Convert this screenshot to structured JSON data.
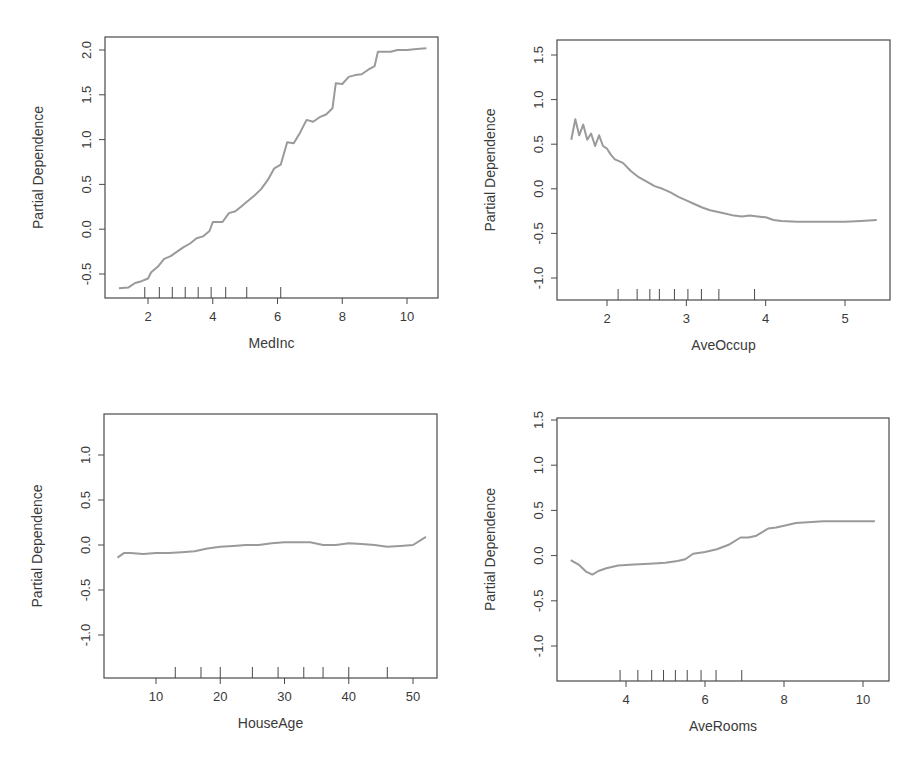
{
  "chart_data": [
    {
      "type": "line",
      "title": "",
      "xlabel": "MedInc",
      "ylabel": "Partial Dependence",
      "xlim": [
        0.8,
        11.0
      ],
      "ylim": [
        -0.75,
        2.1
      ],
      "xticks": [
        2,
        4,
        6,
        8,
        10
      ],
      "yticks": [
        -0.5,
        0.0,
        0.5,
        1.0,
        1.5,
        2.0
      ],
      "rug_deciles": [
        1.9,
        2.35,
        2.75,
        3.15,
        3.55,
        3.95,
        4.4,
        5.05,
        6.1
      ],
      "series": [
        {
          "name": "MedInc",
          "x": [
            1.1,
            1.4,
            1.6,
            1.8,
            2.0,
            2.1,
            2.3,
            2.5,
            2.7,
            2.9,
            3.1,
            3.3,
            3.5,
            3.7,
            3.9,
            4.0,
            4.1,
            4.3,
            4.5,
            4.7,
            4.9,
            5.1,
            5.3,
            5.5,
            5.7,
            5.9,
            6.1,
            6.3,
            6.5,
            6.7,
            6.9,
            7.1,
            7.3,
            7.5,
            7.7,
            7.8,
            8.0,
            8.2,
            8.4,
            8.6,
            8.8,
            9.0,
            9.1,
            9.3,
            9.5,
            9.7,
            10.0,
            10.3,
            10.6
          ],
          "y": [
            -0.66,
            -0.65,
            -0.6,
            -0.58,
            -0.55,
            -0.48,
            -0.42,
            -0.33,
            -0.3,
            -0.25,
            -0.2,
            -0.16,
            -0.1,
            -0.08,
            -0.02,
            0.08,
            0.08,
            0.08,
            0.18,
            0.2,
            0.26,
            0.32,
            0.38,
            0.45,
            0.55,
            0.68,
            0.72,
            0.97,
            0.96,
            1.08,
            1.22,
            1.2,
            1.25,
            1.28,
            1.35,
            1.63,
            1.62,
            1.7,
            1.72,
            1.73,
            1.78,
            1.82,
            1.98,
            1.98,
            1.98,
            2.0,
            2.0,
            2.01,
            2.02
          ]
        }
      ]
    },
    {
      "type": "line",
      "title": "",
      "xlabel": "AveOccup",
      "ylabel": "Partial Dependence",
      "xlim": [
        1.4,
        5.5
      ],
      "ylim": [
        -1.25,
        1.65
      ],
      "xticks": [
        2,
        3,
        4,
        5
      ],
      "yticks": [
        -1.0,
        -0.5,
        0.0,
        0.5,
        1.0,
        1.5
      ],
      "rug_deciles": [
        2.14,
        2.38,
        2.54,
        2.66,
        2.85,
        3.02,
        3.19,
        3.41,
        3.86
      ],
      "series": [
        {
          "name": "AveOccup",
          "x": [
            1.55,
            1.6,
            1.65,
            1.7,
            1.75,
            1.8,
            1.85,
            1.9,
            1.95,
            2.0,
            2.05,
            2.1,
            2.2,
            2.3,
            2.4,
            2.5,
            2.6,
            2.7,
            2.8,
            2.9,
            3.0,
            3.1,
            3.2,
            3.3,
            3.4,
            3.5,
            3.6,
            3.7,
            3.8,
            3.9,
            4.0,
            4.1,
            4.2,
            4.4,
            4.6,
            4.8,
            5.0,
            5.2,
            5.4
          ],
          "y": [
            0.55,
            0.78,
            0.6,
            0.72,
            0.55,
            0.62,
            0.48,
            0.6,
            0.48,
            0.45,
            0.38,
            0.33,
            0.29,
            0.2,
            0.13,
            0.08,
            0.03,
            0.0,
            -0.04,
            -0.09,
            -0.13,
            -0.17,
            -0.21,
            -0.24,
            -0.26,
            -0.28,
            -0.3,
            -0.31,
            -0.3,
            -0.31,
            -0.32,
            -0.35,
            -0.36,
            -0.37,
            -0.37,
            -0.37,
            -0.37,
            -0.36,
            -0.35
          ]
        }
      ]
    },
    {
      "type": "line",
      "title": "",
      "xlabel": "HouseAge",
      "ylabel": "Partial Dependence",
      "xlim": [
        2,
        54
      ],
      "ylim": [
        -1.45,
        1.45
      ],
      "xticks": [
        10,
        20,
        30,
        40,
        50
      ],
      "yticks": [
        -1.0,
        -0.5,
        0.0,
        0.5,
        1.0
      ],
      "rug_deciles": [
        13,
        17,
        20,
        25,
        29,
        33,
        36,
        40,
        46
      ],
      "series": [
        {
          "name": "HouseAge",
          "x": [
            4,
            5,
            6,
            8,
            10,
            12,
            14,
            16,
            18,
            20,
            22,
            24,
            26,
            28,
            30,
            32,
            34,
            36,
            38,
            40,
            42,
            44,
            46,
            48,
            50,
            52
          ],
          "y": [
            -0.14,
            -0.09,
            -0.09,
            -0.1,
            -0.09,
            -0.09,
            -0.08,
            -0.07,
            -0.04,
            -0.02,
            -0.01,
            0.0,
            0.0,
            0.02,
            0.03,
            0.03,
            0.03,
            0.0,
            0.0,
            0.02,
            0.01,
            0.0,
            -0.02,
            -0.01,
            0.0,
            0.09
          ]
        }
      ]
    },
    {
      "type": "line",
      "title": "",
      "xlabel": "AveRooms",
      "ylabel": "Partial Dependence",
      "xlim": [
        2.3,
        10.6
      ],
      "ylim": [
        -1.35,
        1.55
      ],
      "xticks": [
        4,
        6,
        8,
        10
      ],
      "yticks": [
        -1.0,
        -0.5,
        0.0,
        0.5,
        1.0,
        1.5
      ],
      "rug_deciles": [
        3.85,
        4.3,
        4.65,
        4.95,
        5.25,
        5.55,
        5.9,
        6.28,
        6.93
      ],
      "series": [
        {
          "name": "AveRooms",
          "x": [
            2.6,
            2.8,
            3.0,
            3.15,
            3.3,
            3.5,
            3.8,
            4.2,
            4.6,
            5.0,
            5.3,
            5.5,
            5.7,
            6.0,
            6.3,
            6.6,
            6.9,
            7.1,
            7.3,
            7.6,
            7.8,
            8.0,
            8.3,
            8.6,
            9.0,
            9.5,
            10.0,
            10.3
          ],
          "y": [
            -0.05,
            -0.1,
            -0.18,
            -0.21,
            -0.17,
            -0.14,
            -0.11,
            -0.1,
            -0.09,
            -0.08,
            -0.06,
            -0.04,
            0.02,
            0.04,
            0.07,
            0.12,
            0.2,
            0.2,
            0.22,
            0.3,
            0.31,
            0.33,
            0.36,
            0.37,
            0.38,
            0.38,
            0.38,
            0.38
          ]
        }
      ]
    }
  ],
  "panels": [
    {
      "xlabel": "MedInc",
      "ylabel": "Partial Dependence",
      "xtick_labels": [
        "2",
        "4",
        "6",
        "8",
        "10"
      ],
      "ytick_labels": [
        "-0.5",
        "0.0",
        "0.5",
        "1.0",
        "1.5",
        "2.0"
      ]
    },
    {
      "xlabel": "AveOccup",
      "ylabel": "Partial Dependence",
      "xtick_labels": [
        "2",
        "3",
        "4",
        "5"
      ],
      "ytick_labels": [
        "-1.0",
        "-0.5",
        "0.0",
        "0.5",
        "1.0",
        "1.5"
      ]
    },
    {
      "xlabel": "HouseAge",
      "ylabel": "Partial Dependence",
      "xtick_labels": [
        "10",
        "20",
        "30",
        "40",
        "50"
      ],
      "ytick_labels": [
        "-1.0",
        "-0.5",
        "0.0",
        "0.5",
        "1.0"
      ]
    },
    {
      "xlabel": "AveRooms",
      "ylabel": "Partial Dependence",
      "xtick_labels": [
        "4",
        "6",
        "8",
        "10"
      ],
      "ytick_labels": [
        "-1.0",
        "-0.5",
        "0.0",
        "0.5",
        "1.0",
        "1.5"
      ]
    }
  ],
  "colors": {
    "axis": "#4a4a4a",
    "line": "#9a9a9a",
    "text": "#3a3a3a"
  }
}
